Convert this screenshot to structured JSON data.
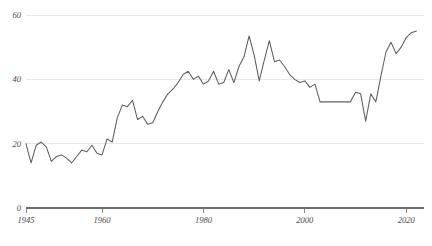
{
  "chart_data": {
    "type": "line",
    "title": "",
    "subtitle": "",
    "xlabel": "",
    "ylabel": "",
    "xlim": [
      1945,
      2023
    ],
    "ylim": [
      0,
      62
    ],
    "grid": true,
    "legend": false,
    "legend_position": "none",
    "line_color": "#5e5e5e",
    "grid_color": "#e8e8e8",
    "axis_color": "#6b6b6b",
    "label_color": "#4a4a4a",
    "y_ticks": [
      0,
      20,
      40,
      60
    ],
    "y_tick_labels": [
      "0",
      "20",
      "40",
      "60"
    ],
    "x_ticks": [
      1945,
      1960,
      1980,
      2000,
      2020
    ],
    "x_tick_labels": [
      "1945",
      "1960",
      "1980",
      "2000",
      "2020"
    ],
    "x": [
      1945,
      1946,
      1947,
      1948,
      1949,
      1950,
      1951,
      1952,
      1953,
      1954,
      1955,
      1956,
      1957,
      1958,
      1959,
      1960,
      1961,
      1962,
      1963,
      1964,
      1965,
      1966,
      1967,
      1968,
      1969,
      1970,
      1971,
      1972,
      1973,
      1974,
      1975,
      1976,
      1977,
      1978,
      1979,
      1980,
      1981,
      1982,
      1983,
      1984,
      1985,
      1986,
      1987,
      1988,
      1989,
      1990,
      1991,
      1992,
      1993,
      1994,
      1995,
      1996,
      1997,
      1998,
      1999,
      2000,
      2001,
      2002,
      2003,
      2004,
      2005,
      2006,
      2007,
      2008,
      2009,
      2010,
      2011,
      2012,
      2013,
      2014,
      2015,
      2016,
      2017,
      2018,
      2019,
      2020,
      2021,
      2022
    ],
    "values": [
      20.0,
      14.0,
      19.5,
      20.5,
      19.0,
      14.5,
      16.0,
      16.5,
      15.5,
      14.0,
      16.0,
      18.0,
      17.5,
      19.5,
      17.0,
      16.5,
      21.5,
      20.5,
      28.0,
      32.0,
      31.5,
      33.5,
      27.5,
      28.5,
      26.0,
      26.5,
      30.0,
      33.0,
      35.5,
      37.0,
      39.0,
      41.5,
      42.5,
      40.0,
      41.0,
      38.5,
      39.5,
      42.5,
      38.5,
      39.0,
      43.0,
      39.0,
      44.0,
      47.0,
      53.5,
      47.5,
      39.5,
      46.0,
      52.0,
      45.5,
      46.0,
      44.0,
      41.5,
      40.0,
      39.0,
      39.5,
      37.5,
      38.5,
      33.0,
      33.0,
      33.0,
      33.0,
      33.0,
      33.0,
      33.0,
      36.0,
      35.5,
      27.0,
      35.5,
      33.0,
      41.0,
      48.5,
      51.5,
      48.0,
      50.0,
      53.0,
      54.5,
      55.0
    ],
    "annotations": []
  },
  "geometry": {
    "plot_left": 26,
    "plot_right": 424,
    "grid_right": 424,
    "y_zero_px": 208,
    "y_top_px": 15,
    "y_value_top": 60,
    "x_start_year": 1945,
    "x_end_year": 2022,
    "px_per_year": 5.07
  }
}
